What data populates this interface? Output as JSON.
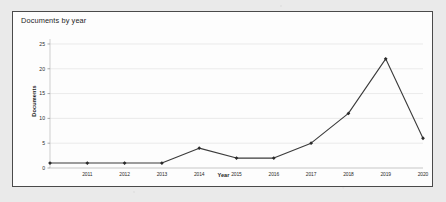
{
  "page": {
    "background_color": "#eaeaea",
    "card_background_color": "#fdfdfd",
    "card_border_color": "#4a4a4a"
  },
  "chart_panel": {
    "title": "Documents by year"
  },
  "chart_data": {
    "type": "line",
    "title": "Documents by year",
    "xlabel": "Year",
    "ylabel": "Documents",
    "categories": [
      "2010",
      "2011",
      "2012",
      "2013",
      "2014",
      "2015",
      "2016",
      "2017",
      "2018",
      "2019",
      "2020"
    ],
    "x_tick_labels": [
      "2011",
      "2012",
      "2013",
      "2014",
      "2015",
      "2016",
      "2017",
      "2018",
      "2019",
      "2020"
    ],
    "values": [
      1,
      1,
      1,
      1,
      4,
      2,
      2,
      5,
      11,
      22,
      6
    ],
    "y_tick_labels": [
      "0",
      "5",
      "10",
      "15",
      "20",
      "25"
    ],
    "y_ticks": [
      0,
      5,
      10,
      15,
      20,
      25
    ],
    "ylim": [
      0,
      26
    ],
    "grid": "horizontal",
    "legend": "none",
    "series_color": "#3b3b3b",
    "marker": "diamond",
    "marker_color": "#2b2b2b",
    "gridline_color": "#e3e3e3",
    "axis_color": "#b9b9b9"
  }
}
